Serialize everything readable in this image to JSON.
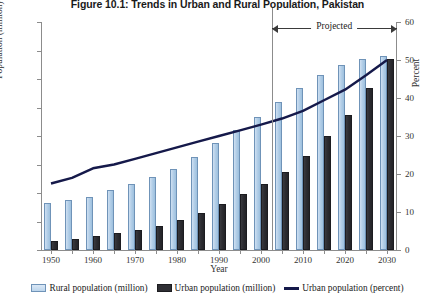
{
  "chart_data": {
    "type": "bar",
    "title": "Figure 10.1: Trends in Urban and Rural Population, Pakistan",
    "xlabel": "Year",
    "ylabel": "Population (million)",
    "ylabel_secondary": "Percent",
    "categories": [
      1950,
      1955,
      1960,
      1965,
      1970,
      1975,
      1980,
      1985,
      1990,
      1995,
      2000,
      2005,
      2010,
      2015,
      2020,
      2025,
      2030
    ],
    "xtick_labels": [
      "1950",
      "1960",
      "1970",
      "1980",
      "1990",
      "2000",
      "2010",
      "2020",
      "2030"
    ],
    "xtick_values": [
      1950,
      1960,
      1970,
      1980,
      1990,
      2000,
      2010,
      2020,
      2030
    ],
    "ylim": [
      0,
      160
    ],
    "ytick_labels": [
      "0",
      "20",
      "40",
      "60",
      "80",
      "100",
      "120",
      "140",
      "160"
    ],
    "ytick_values": [
      0,
      20,
      40,
      60,
      80,
      100,
      120,
      140,
      160
    ],
    "ylim_secondary": [
      0,
      60
    ],
    "ytick_labels_secondary": [
      "0",
      "10",
      "20",
      "30",
      "40",
      "50",
      "60"
    ],
    "ytick_values_secondary": [
      0,
      10,
      20,
      30,
      40,
      50,
      60
    ],
    "grid": false,
    "legend_position": "bottom",
    "series": [
      {
        "name": "Rural population (million)",
        "axis": "left",
        "kind": "bar",
        "color": "#bcd5ec",
        "values": [
          33,
          35,
          37,
          42,
          46,
          51,
          57,
          65,
          75,
          84,
          93,
          104,
          114,
          123,
          130,
          134,
          136
        ]
      },
      {
        "name": "Urban population (million)",
        "axis": "left",
        "kind": "bar",
        "color": "#2f2f34",
        "values": [
          6,
          8,
          10,
          12,
          14,
          17,
          21,
          26,
          32,
          39,
          46,
          55,
          66,
          80,
          95,
          114,
          134
        ]
      },
      {
        "name": "Urban population (percent)",
        "axis": "right",
        "kind": "line",
        "color": "#15194a",
        "values": [
          17.5,
          19.0,
          21.5,
          22.5,
          24.0,
          25.5,
          27.0,
          28.5,
          30.0,
          31.5,
          33.0,
          34.6,
          36.6,
          39.4,
          42.2,
          46.0,
          50.0
        ]
      }
    ],
    "annotations": [
      {
        "label": "Projected",
        "type": "range-arrow",
        "from": 2002.5,
        "to": 2030,
        "divider_at": 2002.5
      }
    ]
  }
}
